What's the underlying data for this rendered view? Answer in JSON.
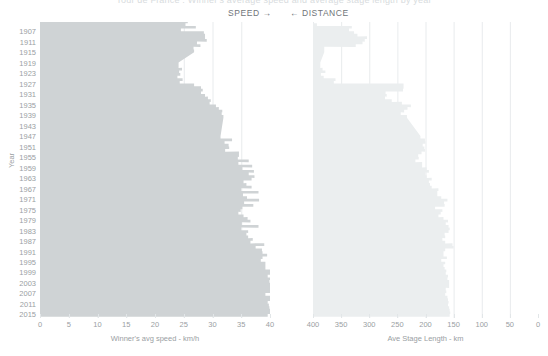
{
  "header": {
    "clipped_title": "Tour de France : Winner's average speed and average stage length by year",
    "speed_direction_label": "SPEED →",
    "distance_direction_label": "← DISTANCE"
  },
  "colors": {
    "speed_area": "#cfd3d5",
    "distance_area": "#ebeeef",
    "gridline": "#e2e6e8",
    "tick_text": "#9aa0a3",
    "background": "#ffffff"
  },
  "yaxis": {
    "label": "Year",
    "ticks": [
      1907,
      1911,
      1915,
      1919,
      1923,
      1927,
      1931,
      1935,
      1939,
      1943,
      1947,
      1951,
      1955,
      1959,
      1963,
      1967,
      1971,
      1975,
      1979,
      1983,
      1987,
      1991,
      1995,
      1999,
      2003,
      2007,
      2011,
      2015
    ],
    "domain": [
      1903,
      2016
    ]
  },
  "chart_data": [
    {
      "type": "area",
      "id": "speed",
      "orientation": "horizontal",
      "title": "Winner's average speed",
      "xlabel": "Winner's avg speed - km/h",
      "ylabel": "Year",
      "xlim": [
        0,
        40
      ],
      "xticks": [
        0,
        5,
        10,
        15,
        20,
        25,
        30,
        35,
        40
      ],
      "ylim": [
        1903,
        2016
      ],
      "grid": true,
      "direction": "left-to-right",
      "x": [
        1903,
        1904,
        1905,
        1906,
        1907,
        1908,
        1909,
        1910,
        1911,
        1912,
        1913,
        1914,
        1919,
        1920,
        1921,
        1922,
        1923,
        1924,
        1925,
        1926,
        1927,
        1928,
        1929,
        1930,
        1931,
        1932,
        1933,
        1934,
        1935,
        1936,
        1937,
        1938,
        1939,
        1947,
        1948,
        1949,
        1950,
        1951,
        1952,
        1953,
        1954,
        1955,
        1956,
        1957,
        1958,
        1959,
        1960,
        1961,
        1962,
        1963,
        1964,
        1965,
        1966,
        1967,
        1968,
        1969,
        1970,
        1971,
        1972,
        1973,
        1974,
        1975,
        1976,
        1977,
        1978,
        1979,
        1980,
        1981,
        1982,
        1983,
        1984,
        1985,
        1986,
        1987,
        1988,
        1989,
        1990,
        1991,
        1992,
        1993,
        1994,
        1995,
        1996,
        1997,
        1998,
        1999,
        2000,
        2001,
        2002,
        2003,
        2004,
        2005,
        2006,
        2007,
        2008,
        2009,
        2010,
        2011,
        2012,
        2013,
        2014,
        2015
      ],
      "values": [
        25.7,
        25.3,
        27.1,
        24.5,
        28.5,
        28.7,
        28.7,
        29.0,
        27.3,
        27.9,
        26.7,
        26.8,
        24.1,
        24.1,
        24.7,
        24.2,
        24.4,
        23.9,
        24.8,
        24.3,
        26.8,
        28.0,
        28.3,
        28.0,
        28.7,
        29.2,
        29.7,
        29.5,
        30.6,
        31.1,
        31.7,
        31.6,
        31.9,
        31.4,
        33.4,
        32.1,
        32.8,
        32.9,
        32.2,
        34.6,
        34.6,
        34.4,
        36.3,
        34.5,
        36.9,
        35.2,
        37.2,
        36.3,
        37.3,
        36.8,
        35.4,
        35.9,
        36.8,
        35.0,
        38.0,
        35.3,
        36.0,
        38.1,
        35.5,
        37.1,
        35.2,
        34.9,
        34.5,
        35.4,
        36.1,
        36.6,
        35.1,
        38.0,
        35.0,
        36.2,
        35.9,
        36.2,
        37.0,
        36.6,
        39.0,
        37.5,
        38.6,
        38.7,
        39.5,
        38.7,
        38.4,
        39.2,
        39.2,
        39.2,
        40.0,
        40.3,
        39.6,
        40.1,
        39.9,
        40.9,
        40.5,
        41.6,
        40.8,
        39.2,
        40.5,
        40.3,
        39.6,
        39.8,
        39.9,
        40.5,
        40.7,
        39.6
      ],
      "gaps": [
        [
          1915,
          1918
        ],
        [
          1940,
          1946
        ]
      ]
    },
    {
      "type": "area",
      "id": "distance",
      "orientation": "horizontal",
      "title": "Average stage length",
      "xlabel": "Ave Stage Length - km",
      "ylabel": "Year",
      "xlim": [
        400,
        0
      ],
      "xticks": [
        400,
        350,
        300,
        250,
        200,
        150,
        100,
        50,
        0
      ],
      "ylim": [
        1903,
        2016
      ],
      "grid": true,
      "direction": "right-to-left",
      "x": [
        1903,
        1904,
        1905,
        1906,
        1907,
        1908,
        1909,
        1910,
        1911,
        1912,
        1913,
        1914,
        1919,
        1920,
        1921,
        1922,
        1923,
        1924,
        1925,
        1926,
        1927,
        1928,
        1929,
        1930,
        1931,
        1932,
        1933,
        1934,
        1935,
        1936,
        1937,
        1938,
        1939,
        1947,
        1948,
        1949,
        1950,
        1951,
        1952,
        1953,
        1954,
        1955,
        1956,
        1957,
        1958,
        1959,
        1960,
        1961,
        1962,
        1963,
        1964,
        1965,
        1966,
        1967,
        1968,
        1969,
        1970,
        1971,
        1972,
        1973,
        1974,
        1975,
        1976,
        1977,
        1978,
        1979,
        1980,
        1981,
        1982,
        1983,
        1984,
        1985,
        1986,
        1987,
        1988,
        1989,
        1990,
        1991,
        1992,
        1993,
        1994,
        1995,
        1996,
        1997,
        1998,
        1999,
        2000,
        2001,
        2002,
        2003,
        2004,
        2005,
        2006,
        2007,
        2008,
        2009,
        2010,
        2011,
        2012,
        2013,
        2014,
        2015
      ],
      "values": [
        404,
        393,
        331,
        336,
        327,
        321,
        304,
        308,
        312,
        324,
        380,
        380,
        387,
        387,
        383,
        378,
        386,
        381,
        360,
        363,
        239,
        239,
        240,
        271,
        269,
        272,
        260,
        242,
        226,
        232,
        238,
        244,
        233,
        209,
        201,
        200,
        205,
        202,
        201,
        207,
        213,
        212,
        218,
        206,
        206,
        198,
        194,
        200,
        198,
        189,
        194,
        192,
        189,
        177,
        179,
        179,
        172,
        161,
        167,
        166,
        183,
        170,
        173,
        177,
        168,
        160,
        164,
        159,
        157,
        159,
        166,
        165,
        170,
        165,
        152,
        150,
        165,
        168,
        168,
        162,
        172,
        165,
        168,
        166,
        163,
        164,
        160,
        161,
        158,
        158,
        158,
        164,
        163,
        165,
        161,
        160,
        159,
        160,
        158,
        157,
        156,
        157
      ],
      "gaps": [
        [
          1915,
          1918
        ],
        [
          1940,
          1946
        ]
      ]
    }
  ]
}
